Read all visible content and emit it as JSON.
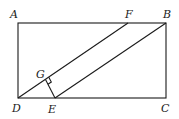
{
  "diagram": {
    "type": "geometry",
    "points": {
      "A": {
        "label": "A",
        "x": 18,
        "y": 23
      },
      "B": {
        "label": "B",
        "x": 166,
        "y": 23
      },
      "C": {
        "label": "C",
        "x": 166,
        "y": 98
      },
      "D": {
        "label": "D",
        "x": 18,
        "y": 98
      },
      "E": {
        "label": "E",
        "x": 55,
        "y": 98
      },
      "F": {
        "label": "F",
        "x": 128,
        "y": 23
      },
      "G": {
        "label": "G",
        "x": 46,
        "y": 81
      }
    },
    "segments": [
      [
        "A",
        "B"
      ],
      [
        "B",
        "C"
      ],
      [
        "C",
        "D"
      ],
      [
        "D",
        "A"
      ],
      [
        "D",
        "F"
      ],
      [
        "E",
        "B"
      ],
      [
        "G",
        "E"
      ]
    ],
    "right_angle_at": "G",
    "colors": {
      "stroke": "#1a1a1a",
      "background": "#ffffff"
    }
  }
}
